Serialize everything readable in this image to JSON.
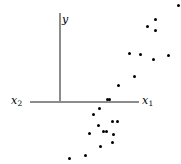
{
  "chart_data": {
    "type": "scatter",
    "title": "",
    "subtitle": "",
    "xlabel": "x_1",
    "ylabel": "y",
    "secondary_axis_label": "x_2",
    "grid": false,
    "legend": false,
    "axes": {
      "vertical": {
        "label": "y",
        "label_display": "y",
        "origin_x_px": 59,
        "top_px": 13,
        "bottom_px": 102
      },
      "horizontal": {
        "label_right": "x_1",
        "label_right_display": "x",
        "label_right_subscript": "1",
        "label_left": "x_2",
        "label_left_display": "x",
        "label_left_subscript": "2",
        "y_px": 101,
        "left_px": 30,
        "right_px": 139
      }
    },
    "axis_color": "#8c8c8c",
    "point_color": "#000000",
    "point_count": 25,
    "points_px": [
      {
        "x": 178,
        "y": 5
      },
      {
        "x": 155,
        "y": 19
      },
      {
        "x": 155,
        "y": 30
      },
      {
        "x": 168,
        "y": 55
      },
      {
        "x": 140,
        "y": 54
      },
      {
        "x": 153,
        "y": 59
      },
      {
        "x": 129,
        "y": 53
      },
      {
        "x": 134,
        "y": 76
      },
      {
        "x": 118,
        "y": 85
      },
      {
        "x": 107,
        "y": 99
      },
      {
        "x": 109,
        "y": 99
      },
      {
        "x": 99,
        "y": 108
      },
      {
        "x": 93,
        "y": 114
      },
      {
        "x": 112,
        "y": 121
      },
      {
        "x": 117,
        "y": 121
      },
      {
        "x": 98,
        "y": 125
      },
      {
        "x": 89,
        "y": 133
      },
      {
        "x": 103,
        "y": 131
      },
      {
        "x": 106,
        "y": 131
      },
      {
        "x": 113,
        "y": 134
      },
      {
        "x": 100,
        "y": 146
      },
      {
        "x": 112,
        "y": 142
      },
      {
        "x": 85,
        "y": 155
      },
      {
        "x": 69,
        "y": 158
      },
      {
        "x": 147,
        "y": 26
      }
    ]
  }
}
